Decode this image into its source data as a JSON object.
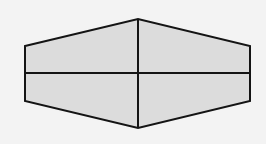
{
  "diagram": {
    "type": "hexagon-divided",
    "background": "#f3f3f3",
    "fill": "#dcdcdc",
    "stroke": "#141414",
    "stroke_width": 2,
    "vertices": [
      [
        25,
        46
      ],
      [
        138,
        19
      ],
      [
        250,
        46
      ],
      [
        250,
        101
      ],
      [
        138,
        128
      ],
      [
        25,
        101
      ]
    ],
    "lines": [
      {
        "name": "vertical-divider",
        "x1": 138,
        "y1": 19,
        "x2": 138,
        "y2": 128
      },
      {
        "name": "horizontal-divider",
        "x1": 25,
        "y1": 73,
        "x2": 250,
        "y2": 73
      }
    ]
  }
}
